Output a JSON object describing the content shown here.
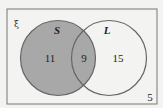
{
  "diagram": {
    "type": "venn",
    "universal_symbol": "ξ",
    "sets": [
      {
        "name": "S",
        "shaded": true
      },
      {
        "name": "L",
        "shaded": false
      }
    ],
    "regions": {
      "s_only": "11",
      "s_and_l": "9",
      "l_only": "15",
      "outside": "5"
    },
    "colors": {
      "background": "#f3f3f1",
      "shade": "#a8a8a8",
      "stroke": "#666666"
    }
  }
}
